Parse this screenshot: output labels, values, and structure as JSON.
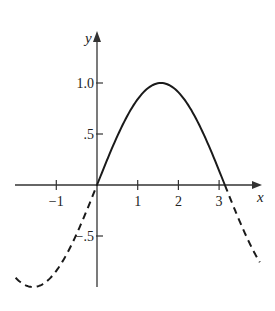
{
  "chart_data": {
    "type": "line",
    "title": "",
    "xlabel": "x",
    "ylabel": "y",
    "function": "y = sin(x)",
    "xlim": [
      -2.0,
      4.0
    ],
    "ylim": [
      -1.0,
      1.25
    ],
    "x_ticks": [
      -1,
      1,
      2,
      3
    ],
    "x_tick_labels": [
      "−1",
      "1",
      "2",
      "3"
    ],
    "y_ticks": [
      1.0,
      0.5,
      -0.5
    ],
    "y_tick_labels": [
      "1.0",
      ".5",
      "−.5"
    ],
    "grid": false,
    "legend": null,
    "series": [
      {
        "name": "sin(x) on [0, π]",
        "style": "solid",
        "x": [
          0,
          0.5,
          1.0,
          1.5708,
          2.0,
          2.5,
          3.1416
        ],
        "y": [
          0,
          0.479,
          0.841,
          1.0,
          0.909,
          0.598,
          0
        ]
      },
      {
        "name": "sin(x) on [-2, 0]",
        "style": "dashed",
        "x": [
          -2.0,
          -1.5708,
          -1.0,
          -0.5,
          0
        ],
        "y": [
          -0.909,
          -1.0,
          -0.841,
          -0.479,
          0
        ]
      },
      {
        "name": "sin(x) on [π, 4]",
        "style": "dashed",
        "x": [
          3.1416,
          3.5,
          4.0
        ],
        "y": [
          0,
          -0.351,
          -0.757
        ]
      }
    ],
    "colors": {
      "curve": "#1a1a1a",
      "axes": "#333333"
    }
  }
}
